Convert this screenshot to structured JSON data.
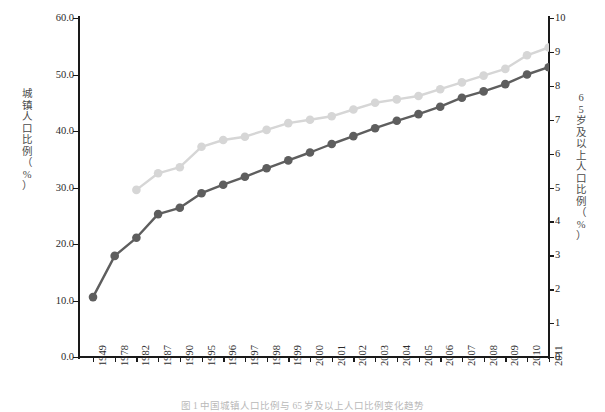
{
  "chart_data": {
    "type": "line",
    "title": "",
    "categories": [
      "1949",
      "1978",
      "1982",
      "1987",
      "1990",
      "1995",
      "1996",
      "1997",
      "1998",
      "1999",
      "2000",
      "2001",
      "2002",
      "2003",
      "2004",
      "2005",
      "2006",
      "2007",
      "2008",
      "2009",
      "2010",
      "2011"
    ],
    "series": [
      {
        "name": "城镇人口比例",
        "axis": "left",
        "color": "#5e5e5e",
        "values": [
          10.6,
          17.9,
          21.1,
          25.3,
          26.4,
          29.0,
          30.5,
          31.9,
          33.4,
          34.8,
          36.2,
          37.7,
          39.1,
          40.5,
          41.8,
          43.0,
          44.3,
          45.9,
          47.0,
          48.3,
          50.0,
          51.3
        ]
      },
      {
        "name": "65岁及以上人口比例",
        "axis": "right",
        "color": "#d6d6d6",
        "values": [
          null,
          null,
          4.93,
          5.42,
          5.6,
          6.2,
          6.4,
          6.5,
          6.7,
          6.9,
          7.0,
          7.1,
          7.3,
          7.5,
          7.6,
          7.7,
          7.9,
          8.1,
          8.3,
          8.5,
          8.9,
          9.13
        ]
      }
    ],
    "left_axis": {
      "label_chars": [
        "城",
        "镇",
        "人",
        "口",
        "比",
        "例",
        "（",
        "%",
        "）"
      ],
      "label": "城镇人口比例（%）",
      "ticks": [
        "0.0",
        "10.0",
        "20.0",
        "30.0",
        "40.0",
        "50.0",
        "60.0"
      ],
      "min": 0,
      "max": 60
    },
    "right_axis": {
      "label_chars": [
        "6",
        "5",
        "岁",
        "及",
        "以",
        "上",
        "人",
        "口",
        "比",
        "例",
        "（",
        "%",
        "）"
      ],
      "label": "65岁及以上人口比例（%）",
      "ticks": [
        "0",
        "1",
        "2",
        "3",
        "4",
        "5",
        "6",
        "7",
        "8",
        "9",
        "10"
      ],
      "min": 0,
      "max": 10
    },
    "xlabel": "",
    "grid": false,
    "legend": "none"
  },
  "caption": "图 1  中国城镇人口比例与 65 岁及以上人口比例变化趋势"
}
